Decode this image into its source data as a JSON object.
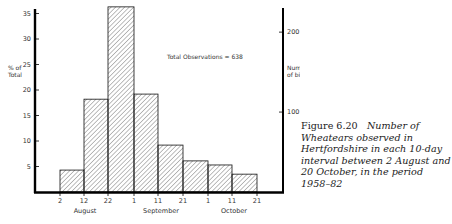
{
  "chart_data": {
    "type": "bar",
    "title": "",
    "annotation": "Total Observations = 638",
    "xlabel": "",
    "ylabel": "% of Total",
    "ylabel_right": "Number of birds",
    "ylim": [
      0,
      36
    ],
    "left_ticks": [
      5,
      10,
      15,
      20,
      25,
      30,
      35
    ],
    "right_ticks": [
      100,
      200
    ],
    "x_tick_labels": [
      "2",
      "12",
      "22",
      "1",
      "11",
      "21",
      "1",
      "11",
      "21"
    ],
    "month_labels": [
      "August",
      "September",
      "October"
    ],
    "categories": [
      "2–11 Aug",
      "12–21 Aug",
      "22–31 Aug",
      "1–10 Sep",
      "11–20 Sep",
      "21–30 Sep",
      "1–10 Oct",
      "11–20 Oct"
    ],
    "values": [
      4.3,
      18.2,
      36.3,
      19.2,
      9.2,
      6.1,
      5.3,
      3.5
    ],
    "grid": false,
    "legend": null
  },
  "caption": {
    "number": "Figure 6.20",
    "text": "Number of Wheatears observed in Hertfordshire in each 10-day interval between 2 August and 20 October, in the period 1958–82"
  }
}
